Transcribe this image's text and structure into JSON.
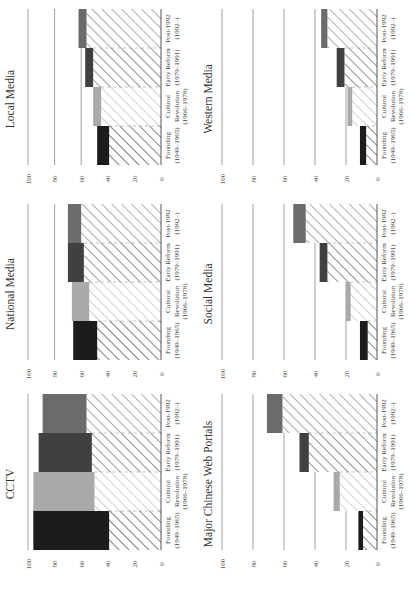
{
  "periods": [
    {
      "label": "Founding",
      "years": "(1949–1965)"
    },
    {
      "label": "Cultural",
      "label2": "Revolution",
      "years": "(1966–1978)"
    },
    {
      "label": "Early Reform",
      "years": "(1979–1991)"
    },
    {
      "label": "Post-1992",
      "years": "(1992–)"
    }
  ],
  "colors": {
    "founding": "#1c1c1c",
    "cultural": "#a9a9a9",
    "early_reform": "#404040",
    "post_1992": "#6b6b6b",
    "gridline": "#8a8a8a",
    "axis": "#555555"
  },
  "y_ticks": [
    "0",
    "20",
    "40",
    "60",
    "80",
    "100"
  ],
  "panels": [
    {
      "title": "CCTV"
    },
    {
      "title": "National Media"
    },
    {
      "title": "Local Media"
    },
    {
      "title": "Major Chinese Web Portals"
    },
    {
      "title": "Social Media"
    },
    {
      "title": "Western Media"
    }
  ],
  "chart_data": [
    {
      "type": "bar",
      "title": "CCTV",
      "categories": [
        "Founding (1949–1965)",
        "Cultural Revolution (1966–1978)",
        "Early Reform (1979–1991)",
        "Post-1992 (1992–)"
      ],
      "series": [
        {
          "name": "hatched (lower bound)",
          "values": [
            39,
            50,
            52,
            56
          ]
        },
        {
          "name": "solid (upper bound)",
          "values": [
            96,
            96,
            92,
            89
          ]
        }
      ],
      "xlabel": "",
      "ylabel": "",
      "ylim": [
        0,
        100
      ],
      "grid": true
    },
    {
      "type": "bar",
      "title": "National Media",
      "categories": [
        "Founding (1949–1965)",
        "Cultural Revolution (1966–1978)",
        "Early Reform (1979–1991)",
        "Post-1992 (1992–)"
      ],
      "series": [
        {
          "name": "hatched (lower bound)",
          "values": [
            48,
            54,
            58,
            60
          ]
        },
        {
          "name": "solid (upper bound)",
          "values": [
            66,
            67,
            70,
            70
          ]
        }
      ],
      "xlabel": "",
      "ylabel": "",
      "ylim": [
        0,
        100
      ],
      "grid": true
    },
    {
      "type": "bar",
      "title": "Local Media",
      "categories": [
        "Founding (1949–1965)",
        "Cultural Revolution (1966–1978)",
        "Early Reform (1979–1991)",
        "Post-1992 (1992–)"
      ],
      "series": [
        {
          "name": "hatched (lower bound)",
          "values": [
            39,
            45,
            51,
            56
          ]
        },
        {
          "name": "solid (upper bound)",
          "values": [
            48,
            51,
            57,
            62
          ]
        }
      ],
      "xlabel": "",
      "ylabel": "",
      "ylim": [
        0,
        100
      ],
      "grid": true
    },
    {
      "type": "bar",
      "title": "Major Chinese Web Portals",
      "categories": [
        "Founding (1949–1965)",
        "Cultural Revolution (1966–1978)",
        "Early Reform (1979–1991)",
        "Post-1992 (1992–)"
      ],
      "series": [
        {
          "name": "hatched (lower bound)",
          "values": [
            9,
            24,
            44,
            61
          ]
        },
        {
          "name": "solid (upper bound)",
          "values": [
            12,
            28,
            50,
            71
          ]
        }
      ],
      "xlabel": "",
      "ylabel": "",
      "ylim": [
        0,
        100
      ],
      "grid": true
    },
    {
      "type": "bar",
      "title": "Social Media",
      "categories": [
        "Founding (1949–1965)",
        "Cultural Revolution (1966–1978)",
        "Early Reform (1979–1991)",
        "Post-1992 (1992–)"
      ],
      "series": [
        {
          "name": "hatched (lower bound)",
          "values": [
            6,
            17,
            32,
            46
          ]
        },
        {
          "name": "solid (upper bound)",
          "values": [
            11,
            20,
            37,
            54
          ]
        }
      ],
      "xlabel": "",
      "ylabel": "",
      "ylim": [
        0,
        100
      ],
      "grid": true
    },
    {
      "type": "bar",
      "title": "Western Media",
      "categories": [
        "Founding (1949–1965)",
        "Cultural Revolution (1966–1978)",
        "Early Reform (1979–1991)",
        "Post-1992 (1992–)"
      ],
      "series": [
        {
          "name": "hatched (lower bound)",
          "values": [
            7,
            16,
            21,
            32
          ]
        },
        {
          "name": "solid (upper bound)",
          "values": [
            11,
            19,
            26,
            36
          ]
        }
      ],
      "xlabel": "",
      "ylabel": "",
      "ylim": [
        0,
        100
      ],
      "grid": true
    }
  ]
}
